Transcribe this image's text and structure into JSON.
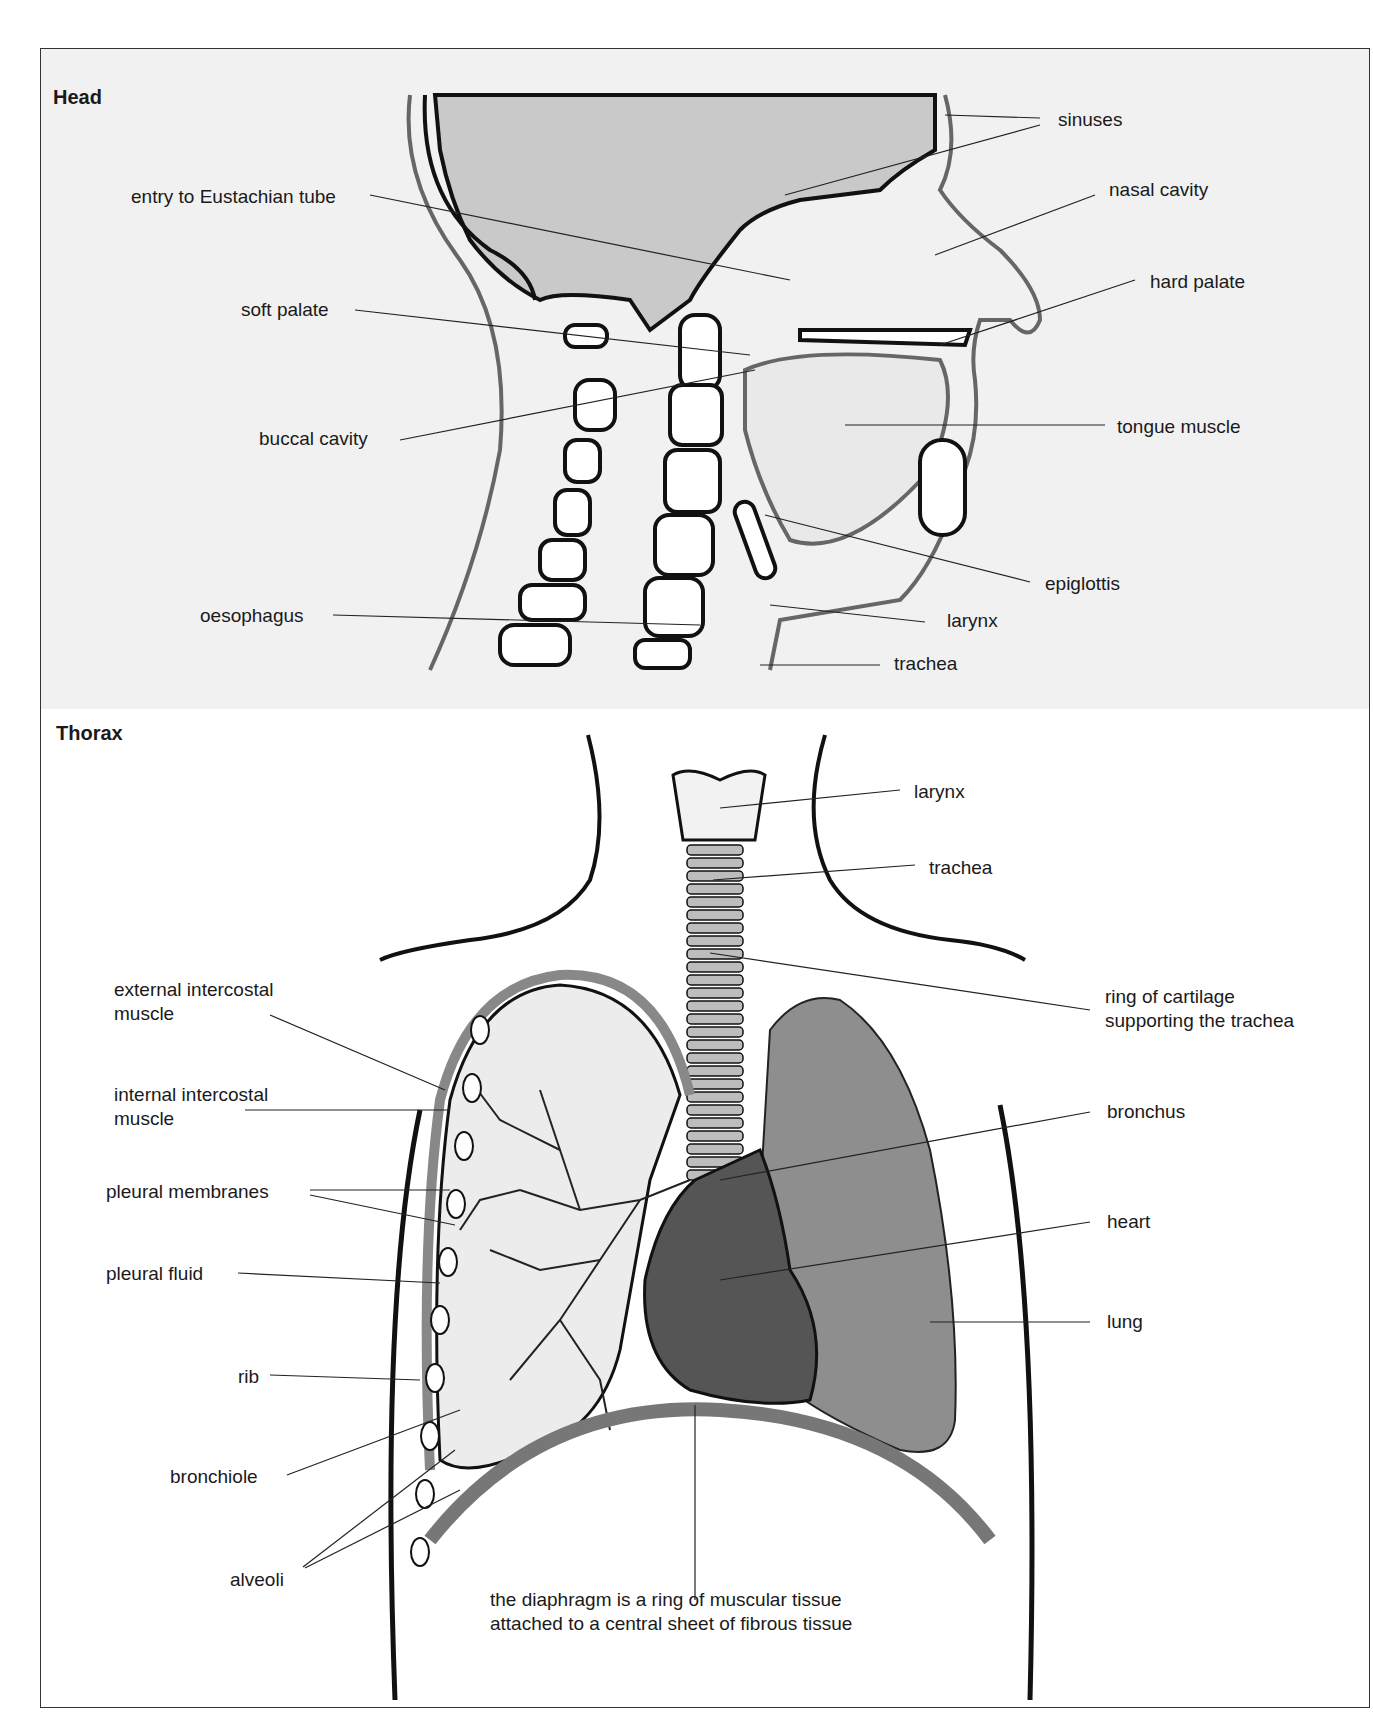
{
  "head": {
    "title": "Head",
    "labels": {
      "sinuses": "sinuses",
      "eustachian": "entry to Eustachian tube",
      "nasal_cavity": "nasal cavity",
      "hard_palate": "hard palate",
      "soft_palate": "soft palate",
      "buccal_cavity": "buccal cavity",
      "tongue_muscle": "tongue muscle",
      "epiglottis": "epiglottis",
      "oesophagus": "oesophagus",
      "larynx": "larynx",
      "trachea": "trachea"
    }
  },
  "thorax": {
    "title": "Thorax",
    "labels": {
      "larynx": "larynx",
      "trachea": "trachea",
      "ring_cartilage": "ring of cartilage\nsupporting the trachea",
      "external_intercostal": "external intercostal\nmuscle",
      "internal_intercostal": "internal intercostal\nmuscle",
      "bronchus": "bronchus",
      "pleural_membranes": "pleural membranes",
      "heart": "heart",
      "pleural_fluid": "pleural fluid",
      "lung": "lung",
      "rib": "rib",
      "bronchiole": "bronchiole",
      "alveoli": "alveoli",
      "diaphragm": "the diaphragm is a ring of muscular tissue\nattached to a central sheet of fibrous tissue"
    }
  },
  "colors": {
    "head_background": "#f1f1f1",
    "skull_fill": "#c9c9c9",
    "outline": "#111111",
    "soft_tissue_outline": "#666666",
    "lung_fill": "#8a8a8a",
    "heart_fill": "#555555"
  }
}
